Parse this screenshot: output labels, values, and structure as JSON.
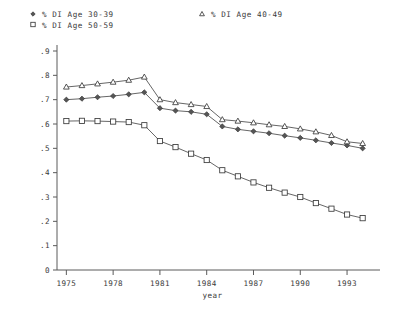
{
  "chart_data": {
    "type": "line",
    "title": "",
    "xlabel": "year",
    "ylabel": "",
    "x": [
      1975,
      1976,
      1977,
      1978,
      1979,
      1980,
      1981,
      1982,
      1983,
      1984,
      1985,
      1986,
      1987,
      1988,
      1989,
      1990,
      1991,
      1992,
      1993,
      1994
    ],
    "xlim": [
      1974.4,
      1994.6
    ],
    "ylim": [
      0,
      0.9
    ],
    "xticks": [
      1975,
      1978,
      1981,
      1984,
      1987,
      1990,
      1993
    ],
    "xticklabels": [
      "1975",
      "1978",
      "1981",
      "1984",
      "1987",
      "1990",
      "1993"
    ],
    "yticks": [
      0,
      0.1,
      0.2,
      0.3,
      0.4,
      0.5,
      0.6,
      0.7,
      0.8,
      0.9
    ],
    "yticklabels": [
      "0",
      ".1",
      ".2",
      ".3",
      ".4",
      ".5",
      ".6",
      ".7",
      ".8",
      ".9"
    ],
    "grid": false,
    "legend_position": "above-plot",
    "series": [
      {
        "name": "% DI Age 30-39",
        "marker": "diamond",
        "values": [
          0.7,
          0.704,
          0.71,
          0.715,
          0.722,
          0.73,
          0.665,
          0.655,
          0.65,
          0.64,
          0.59,
          0.578,
          0.57,
          0.562,
          0.552,
          0.543,
          0.533,
          0.522,
          0.512,
          0.5
        ]
      },
      {
        "name": "% DI Age 40-49",
        "marker": "triangle",
        "values": [
          0.752,
          0.758,
          0.765,
          0.772,
          0.78,
          0.793,
          0.7,
          0.688,
          0.68,
          0.672,
          0.618,
          0.612,
          0.605,
          0.597,
          0.59,
          0.58,
          0.568,
          0.553,
          0.527,
          0.52
        ]
      },
      {
        "name": "% DI Age 50-59",
        "marker": "square",
        "values": [
          0.612,
          0.613,
          0.612,
          0.61,
          0.608,
          0.595,
          0.53,
          0.505,
          0.478,
          0.452,
          0.41,
          0.385,
          0.36,
          0.338,
          0.318,
          0.3,
          0.275,
          0.252,
          0.228,
          0.213
        ]
      }
    ]
  },
  "legend": {
    "entries": [
      {
        "label": "% DI Age 30-39",
        "marker": "diamond"
      },
      {
        "label": "% DI Age 50-59",
        "marker": "square"
      },
      {
        "label": "% DI Age 40-49",
        "marker": "triangle"
      }
    ]
  },
  "axis": {
    "x_title": "year"
  }
}
